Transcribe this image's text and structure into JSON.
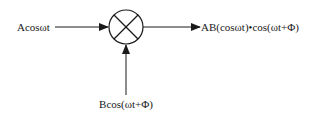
{
  "diagram": {
    "type": "mixer-block-diagram",
    "input_left": {
      "label": "Acosωt"
    },
    "input_bottom": {
      "label": "Bcos(ωt+Φ)"
    },
    "output": {
      "label": "AB(cosωt)•cos(ωt+Φ)"
    },
    "mixer_symbol": "multiplier-circle-x-icon",
    "colors": {
      "stroke": "#1a1a1a",
      "background": "#ffffff"
    }
  }
}
